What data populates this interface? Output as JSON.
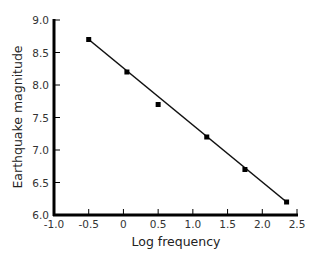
{
  "chart_data": {
    "type": "scatter",
    "title": "",
    "xlabel": "Log frequency",
    "ylabel": "Earthquake magnitude",
    "xlim": [
      -1.0,
      2.5
    ],
    "ylim": [
      6.0,
      9.0
    ],
    "x_ticks": [
      "-1.0",
      "-0.5",
      "0",
      "0.5",
      "1.0",
      "1.5",
      "2.0",
      "2.5"
    ],
    "x_tick_values": [
      -1.0,
      -0.5,
      0,
      0.5,
      1.0,
      1.5,
      2.0,
      2.5
    ],
    "y_ticks": [
      "6.0",
      "6.5",
      "7.0",
      "7.5",
      "8.0",
      "8.5",
      "9.0"
    ],
    "y_tick_values": [
      6.0,
      6.5,
      7.0,
      7.5,
      8.0,
      8.5,
      9.0
    ],
    "grid": false,
    "legend": null,
    "series": [
      {
        "name": "observations",
        "marker": "square",
        "x": [
          -0.5,
          0.05,
          0.5,
          1.2,
          1.75,
          2.35
        ],
        "y": [
          8.7,
          8.2,
          7.7,
          7.2,
          6.7,
          6.2
        ]
      }
    ],
    "fit_line": {
      "x": [
        -0.5,
        2.35
      ],
      "y": [
        8.7,
        6.2
      ]
    },
    "colors": {
      "line": "#111111",
      "marker": "#000000",
      "axis": "#000000"
    }
  }
}
